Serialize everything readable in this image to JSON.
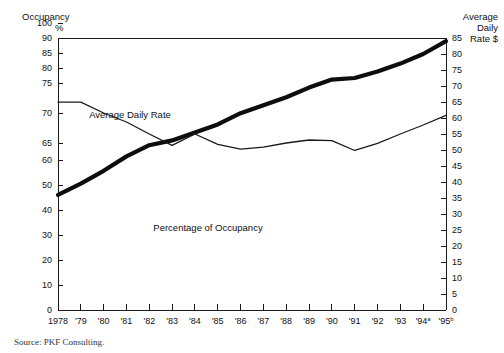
{
  "chart_data": {
    "type": "line",
    "title": "",
    "subtitle": "",
    "xlabel": "",
    "ylabel": "Occupancy %",
    "y2label": "Average Daily Rate $",
    "grid": false,
    "legend_position": "inline-annotations",
    "x": [
      "1978",
      "'79",
      "'80",
      "'81",
      "'82",
      "'83",
      "'84",
      "'85",
      "'86",
      "'87",
      "'88",
      "'89",
      "'90",
      "'91",
      "'92",
      "'93",
      "'94",
      "'95"
    ],
    "x_superscripts": [
      "",
      "",
      "",
      "",
      "",
      "",
      "",
      "",
      "",
      "",
      "",
      "",
      "",
      "",
      "",
      "",
      "a",
      "b"
    ],
    "left_axis": {
      "label_line1": "Occupancy",
      "label_line2": "%",
      "ticks": [
        0,
        10,
        20,
        30,
        40,
        50,
        60,
        65,
        70,
        75,
        80,
        85,
        90,
        100
      ],
      "tick_positions": [
        310,
        285,
        260,
        235,
        210,
        185,
        160,
        143,
        113,
        83,
        68,
        53,
        38,
        23
      ],
      "scale": "nonlinear-broken",
      "range": [
        0,
        100
      ]
    },
    "right_axis": {
      "label_line1": "Average",
      "label_line2": "Daily",
      "label_line3": "Rate $",
      "ticks": [
        0,
        5,
        10,
        15,
        20,
        25,
        30,
        35,
        40,
        45,
        50,
        55,
        60,
        65,
        70,
        75,
        80,
        85
      ],
      "scale": "linear",
      "range": [
        0,
        85
      ]
    },
    "series": [
      {
        "name": "Average Daily Rate",
        "axis": "right",
        "units": "$",
        "style": "thick",
        "annotation": "Average Daily Rate",
        "values": [
          36.0,
          39.5,
          43.5,
          48.0,
          51.5,
          53.0,
          55.5,
          58.0,
          61.5,
          64.0,
          66.5,
          69.5,
          72.0,
          72.5,
          74.5,
          77.0,
          80.0,
          84.0
        ]
      },
      {
        "name": "Percentage of Occupancy",
        "axis": "left",
        "units": "%",
        "style": "thin",
        "annotation": "Percentage of Occupancy",
        "values": [
          71.8,
          71.8,
          70.0,
          68.5,
          66.5,
          64.3,
          66.5,
          64.6,
          63.2,
          63.8,
          65.0,
          65.5,
          65.4,
          62.8,
          64.9,
          66.5,
          68.0,
          69.6
        ]
      }
    ],
    "annotations": [
      {
        "text": "Average Daily Rate",
        "x": 130,
        "y": 118
      },
      {
        "text": "Percentage of Occupancy",
        "x": 208,
        "y": 231
      }
    ],
    "source": "Source: PKF Consulting."
  }
}
